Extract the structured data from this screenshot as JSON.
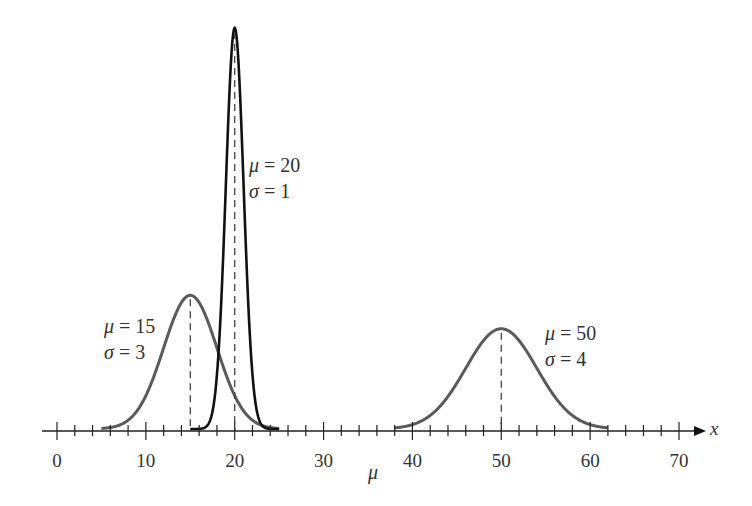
{
  "chart_data": {
    "type": "line",
    "title": "",
    "xlabel": "x",
    "axis_sublabel": "μ",
    "ylabel": "",
    "xlim": [
      0,
      70
    ],
    "x_ticks": [
      0,
      10,
      20,
      30,
      40,
      50,
      60,
      70
    ],
    "minor_tick_step": 2,
    "grid": false,
    "legend": "none (inline annotations)",
    "series": [
      {
        "name": "N(μ=15, σ=3)",
        "mu": 15,
        "sigma": 3,
        "x_range": [
          5,
          25
        ],
        "color": "#5a5a5a",
        "annotation": [
          "μ = 15",
          "σ = 3"
        ]
      },
      {
        "name": "N(μ=20, σ=1)",
        "mu": 20,
        "sigma": 1,
        "x_range": [
          15,
          25
        ],
        "color": "#111111",
        "annotation": [
          "μ = 20",
          "σ = 1"
        ]
      },
      {
        "name": "N(μ=50, σ=4)",
        "mu": 50,
        "sigma": 4,
        "x_range": [
          38,
          62
        ],
        "color": "#5a5a5a",
        "annotation": [
          "μ = 50",
          "σ = 4"
        ]
      }
    ],
    "mean_lines": "dashed vertical lines at each μ from axis to peak"
  },
  "layout": {
    "x0_px": 57,
    "x70_px": 679,
    "axis_y_px": 431,
    "unit_peak_px": 401,
    "axis_left_px": 42,
    "axis_right_px": 698
  }
}
